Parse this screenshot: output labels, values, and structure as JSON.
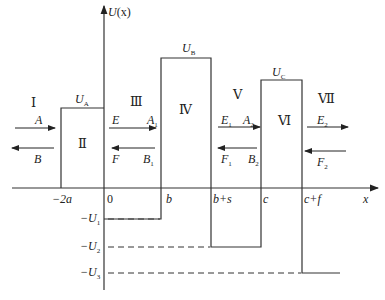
{
  "axes": {
    "y_label": "U(x)",
    "x_label": "x",
    "x_ticks": [
      "-2a",
      "0",
      "b",
      "b+s",
      "c",
      "c+f"
    ],
    "y_ticks": [
      "-U1",
      "-U2",
      "-U3"
    ]
  },
  "potential_levels": {
    "UA": "U_A",
    "UB": "U_B",
    "UC": "U_C"
  },
  "regions": [
    "I",
    "II",
    "III",
    "IV",
    "V",
    "VI",
    "VII"
  ],
  "amplitudes": {
    "region_I": {
      "right": "A",
      "left": "B"
    },
    "region_III": {
      "right_start": "E",
      "right_end": "A1",
      "left_start": "F",
      "left_end": "B1"
    },
    "region_V": {
      "right_start": "E1",
      "right_end": "A2",
      "left_start": "F1",
      "left_end": "B2"
    },
    "region_VII": {
      "right": "E2",
      "left": "F2"
    }
  },
  "labels": {
    "y_axis": {
      "main": "U",
      "paren": "(x)"
    },
    "x_axis": "x",
    "UA": {
      "main": "U",
      "sub": "A"
    },
    "UB": {
      "main": "U",
      "sub": "B"
    },
    "UC": {
      "main": "U",
      "sub": "C"
    },
    "tick_m2a": "−2a",
    "tick_0": "0",
    "tick_b": "b",
    "tick_bs": "b+s",
    "tick_c": "c",
    "tick_cf": "c+f",
    "mU1": {
      "main": "−U",
      "sub": "1"
    },
    "mU2": {
      "main": "−U",
      "sub": "2"
    },
    "mU3": {
      "main": "−U",
      "sub": "3"
    },
    "r1": "Ⅰ",
    "r2": "Ⅱ",
    "r3": "Ⅲ",
    "r4": "Ⅳ",
    "r5": "Ⅴ",
    "r6": "Ⅵ",
    "r7": "Ⅶ",
    "A": "A",
    "B": "B",
    "E": "E",
    "A1": {
      "main": "A",
      "sub": "1"
    },
    "F": "F",
    "B1": {
      "main": "B",
      "sub": "1"
    },
    "E1": {
      "main": "E",
      "sub": "1"
    },
    "A2": {
      "main": "A",
      "sub": "2"
    },
    "F1": {
      "main": "F",
      "sub": "1"
    },
    "B2": {
      "main": "B",
      "sub": "2"
    },
    "E2": {
      "main": "E",
      "sub": "2"
    },
    "F2": {
      "main": "F",
      "sub": "2"
    }
  },
  "colors": {
    "line": "#333333",
    "background": "#ffffff"
  }
}
